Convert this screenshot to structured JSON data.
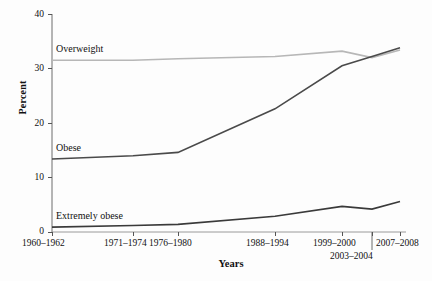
{
  "chart_data": {
    "type": "line",
    "title": "",
    "xlabel": "Years",
    "ylabel": "Percent",
    "categories": [
      "1960–1962",
      "1971–1974",
      "1976–1980",
      "1988–1994",
      "1999–2000",
      "2003–2004",
      "2007–2008"
    ],
    "ylim": [
      0,
      40
    ],
    "yticks": [
      0,
      10,
      20,
      30,
      40
    ],
    "ytick_labels": [
      "0",
      "10",
      "20",
      "30",
      "40"
    ],
    "grid": false,
    "legend": "inline-series-labels",
    "series": [
      {
        "name": "Overweight",
        "color": "#b7b7b7",
        "values": [
          31.5,
          31.5,
          31.8,
          32.2,
          33.2,
          32.0,
          33.4
        ]
      },
      {
        "name": "Obese",
        "color": "#4a4a4a",
        "values": [
          13.4,
          14.0,
          14.6,
          22.6,
          30.5,
          32.2,
          33.8
        ]
      },
      {
        "name": "Extremely obese",
        "color": "#3a3a3a",
        "values": [
          0.9,
          1.2,
          1.4,
          2.9,
          4.7,
          4.2,
          5.6
        ]
      }
    ],
    "annotations": [
      {
        "text": "Overweight",
        "x_category": "1960–1962"
      },
      {
        "text": "Obese",
        "x_category": "1960–1962"
      },
      {
        "text": "Extremely obese",
        "x_category": "1960–1962"
      }
    ]
  },
  "axis": {
    "y_title": "Percent",
    "x_title": "Years",
    "y_ticks": [
      "40",
      "30",
      "20",
      "10",
      "0"
    ],
    "x_ticks": [
      "1960–1962",
      "1971–1974",
      "1976–1980",
      "1988–1994",
      "1999–2000",
      "2003–2004",
      "2007–2008"
    ]
  },
  "labels": {
    "overweight": "Overweight",
    "obese": "Obese",
    "extremely_obese": "Extremely obese"
  }
}
